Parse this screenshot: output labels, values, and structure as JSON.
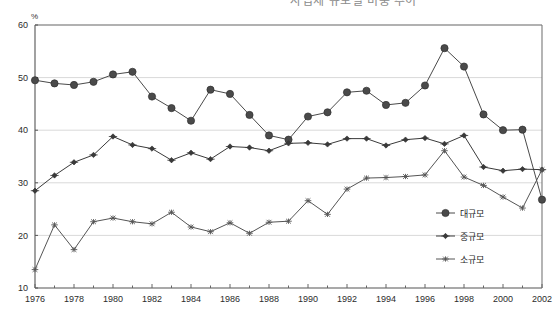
{
  "chart_data": {
    "type": "line",
    "title": "사업체 규모별 비중 추이",
    "xlabel": "",
    "ylabel": "%",
    "ylim": [
      10,
      60
    ],
    "ytick_step": 10,
    "yticks": [
      10,
      20,
      30,
      40,
      50,
      60
    ],
    "xlim": [
      1976,
      2002
    ],
    "xticks": [
      1976,
      1978,
      1980,
      1982,
      1984,
      1986,
      1988,
      1990,
      1992,
      1994,
      1996,
      1998,
      2000,
      2002
    ],
    "grid": "horizontal",
    "legend_position": "inside-right-bottom",
    "x": [
      1976,
      1977,
      1978,
      1979,
      1980,
      1981,
      1982,
      1983,
      1984,
      1985,
      1986,
      1987,
      1988,
      1989,
      1990,
      1991,
      1992,
      1993,
      1994,
      1995,
      1996,
      1997,
      1998,
      1999,
      2000,
      2001,
      2002
    ],
    "series": [
      {
        "name": "대규모",
        "marker": "circle",
        "color": "#4a4a4a",
        "values": [
          49.5,
          48.9,
          48.6,
          49.2,
          50.6,
          51.1,
          46.4,
          44.2,
          41.8,
          47.7,
          46.9,
          42.9,
          39.0,
          38.2,
          42.6,
          43.4,
          47.2,
          47.5,
          44.8,
          45.2,
          48.5,
          55.6,
          52.1,
          43.0,
          40.0,
          40.1,
          26.8
        ]
      },
      {
        "name": "중규모",
        "marker": "diamond",
        "color": "#3a3a3a",
        "values": [
          28.5,
          31.4,
          33.9,
          35.3,
          38.8,
          37.2,
          36.5,
          34.3,
          35.7,
          34.5,
          36.9,
          36.7,
          36.1,
          37.5,
          37.6,
          37.3,
          38.4,
          38.4,
          37.1,
          38.2,
          38.5,
          37.4,
          39.0,
          33.0,
          32.3,
          32.6,
          32.5
        ]
      },
      {
        "name": "소규모",
        "marker": "star",
        "color": "#555555",
        "values": [
          13.5,
          22.0,
          17.3,
          22.6,
          23.3,
          22.6,
          22.2,
          24.4,
          21.6,
          20.7,
          22.4,
          20.4,
          22.5,
          22.7,
          26.6,
          24.0,
          28.8,
          30.9,
          31.0,
          31.2,
          31.5,
          36.1,
          31.1,
          29.5,
          27.3,
          25.2,
          32.5
        ]
      }
    ]
  },
  "legend": {
    "items": [
      {
        "label": "대규모"
      },
      {
        "label": "중규모"
      },
      {
        "label": "소규모"
      }
    ]
  },
  "axis": {
    "unit_label": "%"
  }
}
